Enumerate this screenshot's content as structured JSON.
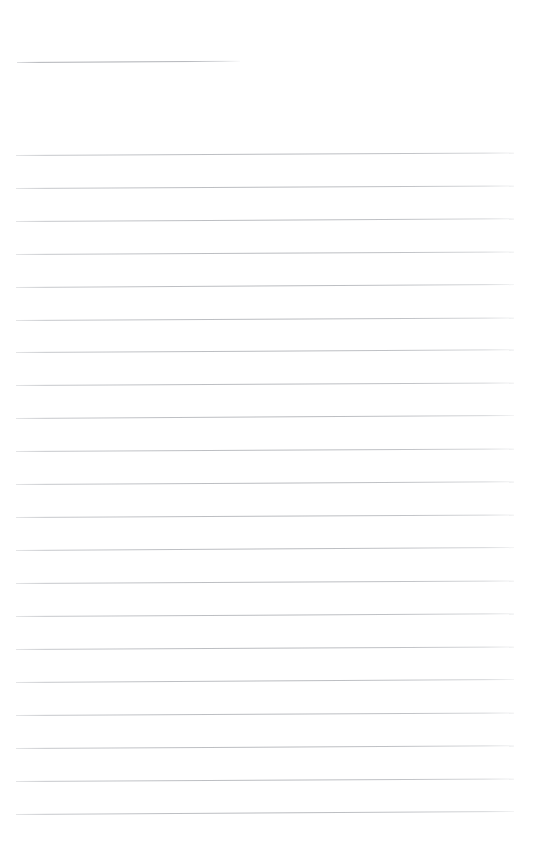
{
  "document": {
    "kind": "blank-lined-page-scan",
    "title": "Blank lined page",
    "page_width": 537,
    "page_height": 863,
    "background_color": "#ffffff",
    "rule_color": "#bcbec2",
    "rule_opacity": "faint",
    "text_content": "",
    "visible_text_lines": [],
    "notes": "Scanned blank ruled sheet: one short underline near the top, followed by a block of full-width horizontal ruled lines. No glyphs or printed text are present."
  },
  "layout": {
    "rule_left_x": 16,
    "rule_right_x": 514,
    "rule_thickness_px": 1,
    "rule_spacing_px": 32.95,
    "slant_rise_px": -3,
    "first_rule_y": 155,
    "last_rule_y": 814,
    "full_rule_count": 21
  },
  "rules": [
    {
      "id": "rule-header-short",
      "label": "short header underline",
      "x": 17,
      "y": 62,
      "width": 223,
      "slant": -1.2,
      "variant": "short"
    },
    {
      "id": "rule-1",
      "label": "ruled line 1",
      "x": 16,
      "y": 155,
      "width": 498,
      "slant": -2.6,
      "variant": "full"
    },
    {
      "id": "rule-2",
      "label": "ruled line 2",
      "x": 16,
      "y": 188,
      "width": 498,
      "slant": -2.6,
      "variant": "full"
    },
    {
      "id": "rule-3",
      "label": "ruled line 3",
      "x": 16,
      "y": 221,
      "width": 498,
      "slant": -2.8,
      "variant": "full"
    },
    {
      "id": "rule-4",
      "label": "ruled line 4",
      "x": 16,
      "y": 254,
      "width": 498,
      "slant": -2.6,
      "variant": "full"
    },
    {
      "id": "rule-5",
      "label": "ruled line 5",
      "x": 16,
      "y": 287,
      "width": 498,
      "slant": -2.9,
      "variant": "full"
    },
    {
      "id": "rule-6",
      "label": "ruled line 6",
      "x": 16,
      "y": 320,
      "width": 498,
      "slant": -2.6,
      "variant": "full"
    },
    {
      "id": "rule-7",
      "label": "ruled line 7",
      "x": 16,
      "y": 352,
      "width": 498,
      "slant": -2.7,
      "variant": "full"
    },
    {
      "id": "rule-8",
      "label": "ruled line 8",
      "x": 16,
      "y": 385,
      "width": 498,
      "slant": -2.6,
      "variant": "full"
    },
    {
      "id": "rule-9",
      "label": "ruled line 9",
      "x": 16,
      "y": 418,
      "width": 498,
      "slant": -3.0,
      "variant": "full"
    },
    {
      "id": "rule-10",
      "label": "ruled line 10",
      "x": 16,
      "y": 451,
      "width": 498,
      "slant": -2.6,
      "variant": "full"
    },
    {
      "id": "rule-11",
      "label": "ruled line 11",
      "x": 16,
      "y": 484,
      "width": 498,
      "slant": -2.8,
      "variant": "full"
    },
    {
      "id": "rule-12",
      "label": "ruled line 12",
      "x": 16,
      "y": 517,
      "width": 498,
      "slant": -2.6,
      "variant": "full"
    },
    {
      "id": "rule-13",
      "label": "ruled line 13",
      "x": 16,
      "y": 550,
      "width": 498,
      "slant": -2.9,
      "variant": "full"
    },
    {
      "id": "rule-14",
      "label": "ruled line 14",
      "x": 16,
      "y": 583,
      "width": 498,
      "slant": -2.6,
      "variant": "full"
    },
    {
      "id": "rule-15",
      "label": "ruled line 15",
      "x": 16,
      "y": 616,
      "width": 498,
      "slant": -2.7,
      "variant": "full"
    },
    {
      "id": "rule-16",
      "label": "ruled line 16",
      "x": 16,
      "y": 649,
      "width": 498,
      "slant": -2.6,
      "variant": "full"
    },
    {
      "id": "rule-17",
      "label": "ruled line 17",
      "x": 16,
      "y": 682,
      "width": 498,
      "slant": -3.0,
      "variant": "full"
    },
    {
      "id": "rule-18",
      "label": "ruled line 18",
      "x": 16,
      "y": 715,
      "width": 498,
      "slant": -2.6,
      "variant": "full"
    },
    {
      "id": "rule-19",
      "label": "ruled line 19",
      "x": 16,
      "y": 748,
      "width": 498,
      "slant": -2.8,
      "variant": "full"
    },
    {
      "id": "rule-20",
      "label": "ruled line 20",
      "x": 16,
      "y": 781,
      "width": 498,
      "slant": -2.6,
      "variant": "full"
    },
    {
      "id": "rule-21",
      "label": "ruled line 21",
      "x": 16,
      "y": 814,
      "width": 498,
      "slant": -3.0,
      "variant": "full"
    }
  ]
}
